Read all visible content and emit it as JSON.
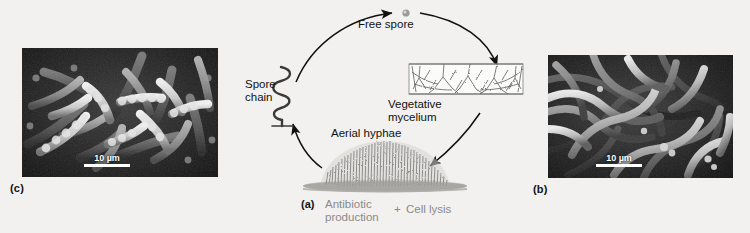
{
  "figure": {
    "background_color": "#f2f1ef",
    "ink_color": "#111111",
    "muted_color": "#8a8a8a"
  },
  "diagram": {
    "nodes": {
      "free_spore": "Free spore",
      "vegetative_mycelium_line1": "Vegetative",
      "vegetative_mycelium_line2": "mycelium",
      "aerial_hyphae": "Aerial hyphae",
      "spore_chain_line1": "Spore",
      "spore_chain_line2": "chain"
    },
    "caption": {
      "panel": "(a)",
      "antibiotic_line1": "Antibiotic",
      "antibiotic_line2": "production",
      "plus": "+",
      "cell_lysis": "Cell lysis"
    }
  },
  "micrographs": [
    {
      "id": "spore-chains-micrograph",
      "panel": "(c)",
      "scale_value": "10",
      "scale_unit": "µm",
      "scale_label": "10 µm"
    },
    {
      "id": "hyphae-micrograph",
      "panel": "(b)",
      "scale_value": "10",
      "scale_unit": "µm",
      "scale_label": "10 µm"
    }
  ]
}
